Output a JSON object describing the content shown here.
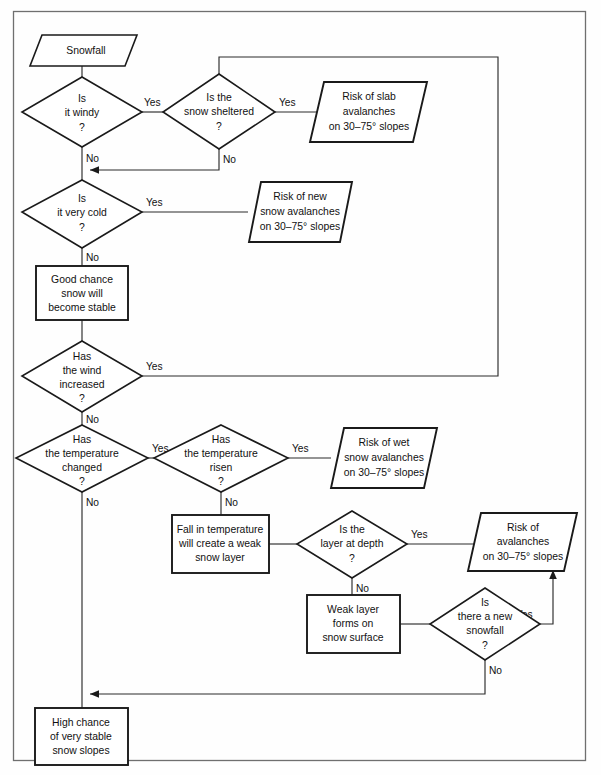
{
  "diagram": {
    "colors": {
      "node_stroke": "#1a1a1a",
      "connector": "#2b2b2b",
      "frame": "#6f6f6f",
      "node_fill": "#ffffff",
      "background": "#fefefe"
    },
    "nodes": [
      {
        "id": "snowfall",
        "shape": "parallelogram",
        "lines": [
          "Snowfall"
        ],
        "line1": "Snowfall"
      },
      {
        "id": "is-it-windy",
        "shape": "diamond",
        "lines": [
          "Is",
          "it windy",
          "?"
        ],
        "line1": "Is",
        "line2": "it windy",
        "line3": "?"
      },
      {
        "id": "is-the-snow-sheltered",
        "shape": "diamond",
        "lines": [
          "Is the",
          "snow sheltered",
          "?"
        ],
        "line1": "Is the",
        "line2": "snow sheltered",
        "line3": "?"
      },
      {
        "id": "risk-of-slab-avalanches",
        "shape": "parallelogram",
        "lines": [
          "Risk of slab",
          "avalanches",
          "on 30–75° slopes"
        ],
        "line1": "Risk of slab",
        "line2": "avalanches",
        "line3": "on 30–75° slopes"
      },
      {
        "id": "is-it-very-cold",
        "shape": "diamond",
        "lines": [
          "Is",
          "it very cold",
          "?"
        ],
        "line1": "Is",
        "line2": "it very cold",
        "line3": "?"
      },
      {
        "id": "risk-of-new-snow-avalanches",
        "shape": "parallelogram",
        "lines": [
          "Risk of new",
          "snow avalanches",
          "on 30–75° slopes"
        ],
        "line1": "Risk of new",
        "line2": "snow avalanches",
        "line3": "on 30–75° slopes"
      },
      {
        "id": "good-chance-snow-stable",
        "shape": "rectangle",
        "lines": [
          "Good chance",
          "snow will",
          "become stable"
        ],
        "line1": "Good chance",
        "line2": "snow will",
        "line3": "become stable"
      },
      {
        "id": "has-the-wind-increased",
        "shape": "diamond",
        "lines": [
          "Has",
          "the wind",
          "increased",
          "?"
        ],
        "line1": "Has",
        "line2": "the wind",
        "line3": "increased",
        "line4": "?"
      },
      {
        "id": "has-the-temperature-changed",
        "shape": "diamond",
        "lines": [
          "Has",
          "the temperature",
          "changed",
          "?"
        ],
        "line1": "Has",
        "line2": "the temperature",
        "line3": "changed",
        "line4": "?"
      },
      {
        "id": "has-the-temperature-risen",
        "shape": "diamond",
        "lines": [
          "Has",
          "the temperature",
          "risen",
          "?"
        ],
        "line1": "Has",
        "line2": "the temperature",
        "line3": "risen",
        "line4": "?"
      },
      {
        "id": "risk-of-wet-snow-avalanches",
        "shape": "parallelogram",
        "lines": [
          "Risk of wet",
          "snow avalanches",
          "on 30–75° slopes"
        ],
        "line1": "Risk of wet",
        "line2": "snow avalanches",
        "line3": "on 30–75° slopes"
      },
      {
        "id": "fall-in-temperature-weak-layer",
        "shape": "rectangle",
        "lines": [
          "Fall in temperature",
          "will create a weak",
          "snow layer"
        ],
        "line1": "Fall in temperature",
        "line2": "will create a weak",
        "line3": "snow layer"
      },
      {
        "id": "is-the-layer-at-depth",
        "shape": "diamond",
        "lines": [
          "Is the",
          "layer at depth",
          "?"
        ],
        "line1": "Is the",
        "line2": "layer at depth",
        "line3": "?"
      },
      {
        "id": "risk-of-avalanches",
        "shape": "parallelogram",
        "lines": [
          "Risk of",
          "avalanches",
          "on 30–75° slopes"
        ],
        "line1": "Risk of",
        "line2": "avalanches",
        "line3": "on 30–75° slopes"
      },
      {
        "id": "weak-layer-forms-on-snow-surface",
        "shape": "rectangle",
        "lines": [
          "Weak layer",
          "forms on",
          "snow surface"
        ],
        "line1": "Weak layer",
        "line2": "forms on",
        "line3": "snow surface"
      },
      {
        "id": "is-there-a-new-snowfall",
        "shape": "diamond",
        "lines": [
          "Is",
          "there a new",
          "snowfall",
          "?"
        ],
        "line1": "Is",
        "line2": "there a new",
        "line3": "snowfall",
        "line4": "?"
      },
      {
        "id": "high-chance-very-stable",
        "shape": "rectangle",
        "lines": [
          "High chance",
          "of very stable",
          "snow slopes"
        ],
        "line1": "High chance",
        "line2": "of very stable",
        "line3": "snow slopes"
      }
    ],
    "edges": [
      {
        "id": "e1",
        "from": "snowfall",
        "to": "is-it-windy",
        "label": ""
      },
      {
        "id": "e2",
        "from": "is-it-windy",
        "to": "is-the-snow-sheltered",
        "label": "Yes"
      },
      {
        "id": "e3",
        "from": "is-the-snow-sheltered",
        "to": "risk-of-slab-avalanches",
        "label": "Yes"
      },
      {
        "id": "e4",
        "from": "is-the-snow-sheltered",
        "to": "is-it-very-cold",
        "label": "No"
      },
      {
        "id": "e5",
        "from": "is-it-windy",
        "to": "is-it-very-cold",
        "label": "No"
      },
      {
        "id": "e6",
        "from": "is-it-very-cold",
        "to": "risk-of-new-snow-avalanches",
        "label": "Yes"
      },
      {
        "id": "e7",
        "from": "is-it-very-cold",
        "to": "good-chance-snow-stable",
        "label": "No"
      },
      {
        "id": "e8",
        "from": "good-chance-snow-stable",
        "to": "has-the-wind-increased",
        "label": ""
      },
      {
        "id": "e9",
        "from": "has-the-wind-increased",
        "to": "is-the-snow-sheltered",
        "label": "Yes"
      },
      {
        "id": "e10",
        "from": "has-the-wind-increased",
        "to": "has-the-temperature-changed",
        "label": "No"
      },
      {
        "id": "e11",
        "from": "has-the-temperature-changed",
        "to": "has-the-temperature-risen",
        "label": "Yes"
      },
      {
        "id": "e12",
        "from": "has-the-temperature-changed",
        "to": "high-chance-very-stable",
        "label": "No"
      },
      {
        "id": "e13",
        "from": "has-the-temperature-risen",
        "to": "risk-of-wet-snow-avalanches",
        "label": "Yes"
      },
      {
        "id": "e14",
        "from": "has-the-temperature-risen",
        "to": "fall-in-temperature-weak-layer",
        "label": "No"
      },
      {
        "id": "e15",
        "from": "fall-in-temperature-weak-layer",
        "to": "is-the-layer-at-depth",
        "label": ""
      },
      {
        "id": "e16",
        "from": "is-the-layer-at-depth",
        "to": "risk-of-avalanches",
        "label": "Yes"
      },
      {
        "id": "e17",
        "from": "is-the-layer-at-depth",
        "to": "weak-layer-forms-on-snow-surface",
        "label": "No"
      },
      {
        "id": "e18",
        "from": "weak-layer-forms-on-snow-surface",
        "to": "is-there-a-new-snowfall",
        "label": ""
      },
      {
        "id": "e19",
        "from": "is-there-a-new-snowfall",
        "to": "risk-of-avalanches",
        "label": "Yes"
      },
      {
        "id": "e20",
        "from": "is-there-a-new-snowfall",
        "to": "high-chance-very-stable",
        "label": "No"
      }
    ],
    "edge_labels": {
      "windy_yes": "Yes",
      "windy_no": "No",
      "sheltered_yes": "Yes",
      "sheltered_no": "No",
      "verycold_yes": "Yes",
      "verycold_no": "No",
      "windinc_yes": "Yes",
      "windinc_no": "No",
      "tempchanged_yes": "Yes",
      "tempchanged_no": "No",
      "temprisen_yes": "Yes",
      "temprisen_no": "No",
      "layerdepth_yes": "Yes",
      "layerdepth_no": "No",
      "newsnow_yes": "Yes",
      "newsnow_no": "No"
    }
  }
}
